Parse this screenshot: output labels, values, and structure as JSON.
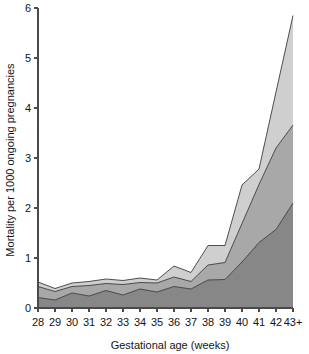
{
  "chart_data": {
    "type": "area",
    "stacked": true,
    "title": "",
    "subtitle": "",
    "xlabel": "Gestational age (weeks)",
    "ylabel": "Mortality per 1000 ongoing pregnancies",
    "categories": [
      "28",
      "29",
      "30",
      "31",
      "32",
      "33",
      "34",
      "35",
      "36",
      "37",
      "38",
      "39",
      "40",
      "41",
      "42",
      "43+"
    ],
    "xtick_labels": [
      "28",
      "29",
      "30",
      "31",
      "32",
      "33",
      "34",
      "35",
      "36",
      "37",
      "38",
      "39",
      "40",
      "41",
      "42",
      "43+"
    ],
    "ytick_labels": [
      "0",
      "1",
      "2",
      "3",
      "4",
      "5",
      "6"
    ],
    "ytick_values": [
      0,
      1,
      2,
      3,
      4,
      5,
      6
    ],
    "ylim": [
      0,
      6
    ],
    "xlim": [
      28,
      43
    ],
    "grid": false,
    "legend": "none",
    "annotations": [],
    "series": [
      {
        "name": "lower-band",
        "color": "#878787",
        "values": [
          0.21,
          0.16,
          0.3,
          0.24,
          0.35,
          0.26,
          0.38,
          0.32,
          0.43,
          0.38,
          0.56,
          0.57,
          0.92,
          1.31,
          1.57,
          2.1
        ]
      },
      {
        "name": "middle-band",
        "color": "#a8a8a8",
        "values": [
          0.22,
          0.17,
          0.13,
          0.21,
          0.14,
          0.21,
          0.13,
          0.18,
          0.19,
          0.15,
          0.3,
          0.34,
          0.77,
          1.16,
          1.63,
          1.56
        ]
      },
      {
        "name": "upper-band",
        "color": "#cfcfcf",
        "values": [
          0.09,
          0.06,
          0.07,
          0.08,
          0.09,
          0.08,
          0.09,
          0.06,
          0.22,
          0.18,
          0.39,
          0.34,
          0.77,
          0.31,
          1.12,
          2.19
        ]
      }
    ],
    "cumulative": {
      "lower": [
        0.21,
        0.16,
        0.3,
        0.24,
        0.35,
        0.26,
        0.38,
        0.32,
        0.43,
        0.38,
        0.56,
        0.57,
        0.92,
        1.31,
        1.57,
        2.1
      ],
      "lower_plus_middle": [
        0.43,
        0.33,
        0.43,
        0.45,
        0.49,
        0.47,
        0.51,
        0.5,
        0.62,
        0.53,
        0.86,
        0.91,
        1.69,
        2.47,
        3.2,
        3.66
      ],
      "total": [
        0.52,
        0.39,
        0.5,
        0.53,
        0.58,
        0.55,
        0.6,
        0.56,
        0.84,
        0.71,
        1.25,
        1.25,
        2.46,
        2.78,
        4.32,
        5.85
      ]
    },
    "colors": {
      "lower_band": "#878787",
      "middle_band": "#a8a8a8",
      "upper_band": "#cfcfcf",
      "outline": "#3c3c3c",
      "axis": "#4a4a4a",
      "background": "#ffffff",
      "text": "#141414"
    }
  }
}
